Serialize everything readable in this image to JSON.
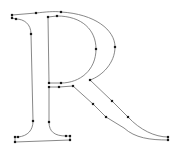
{
  "glyph": {
    "character": "R",
    "stroke_color": "#6a6a6a",
    "node_color": "#1a1a1a",
    "contours": [
      {
        "name": "outer-contour",
        "path": "M12,15 L36,13 C45,12 55,11 61,12 C95,14 115,30 115,47 C115,63 102,76 90,80 L112,101 L128,117 C140,130 155,137 168,137 L168,140 C150,140 135,138 124,128 L106,117 L93,104 L73,86 L59,87 L49,87 L49,122 C49,132 55,136 66,136 L70,136 L70,140 L15,142 L15,137 L18,137 C28,136 33,130 33,121 L31,34 C31,24 24,19 16,19 L12,18 Z"
      },
      {
        "name": "inner-bowl-contour",
        "path": "M48,17 L57,16 C82,16 96,30 96,49 C96,70 80,83 61,83 L49,83 Z"
      }
    ],
    "nodes": [
      [
        12,
        15
      ],
      [
        12,
        18
      ],
      [
        16,
        19
      ],
      [
        36,
        13
      ],
      [
        61,
        12
      ],
      [
        48,
        17
      ],
      [
        57,
        16
      ],
      [
        115,
        47
      ],
      [
        96,
        49
      ],
      [
        31,
        34
      ],
      [
        33,
        121
      ],
      [
        15,
        137
      ],
      [
        18,
        137
      ],
      [
        15,
        142
      ],
      [
        70,
        140
      ],
      [
        66,
        136
      ],
      [
        70,
        136
      ],
      [
        49,
        122
      ],
      [
        49,
        83
      ],
      [
        61,
        83
      ],
      [
        90,
        80
      ],
      [
        49,
        87
      ],
      [
        59,
        87
      ],
      [
        73,
        86
      ],
      [
        112,
        101
      ],
      [
        128,
        117
      ],
      [
        93,
        104
      ],
      [
        106,
        117
      ],
      [
        168,
        137
      ],
      [
        168,
        140
      ]
    ]
  }
}
